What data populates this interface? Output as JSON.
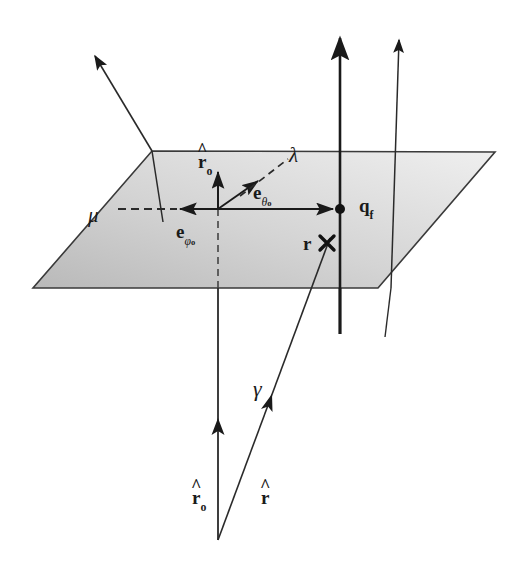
{
  "figure": {
    "kind": "vector-geometry-diagram",
    "background_color": "#ffffff",
    "stroke_color": "#1a1a1a",
    "plane_fill_light": "#e9e9e9",
    "plane_fill_dark": "#bcbcbc"
  },
  "labels": {
    "r_hat_0_plane": {
      "base": "r",
      "hat": "^",
      "sub": "o",
      "x": 198,
      "y": 152,
      "size": 19
    },
    "lambda": {
      "text": "λ",
      "x": 289,
      "y": 147,
      "size": 20
    },
    "e_theta_0": {
      "base": "e",
      "sub": "θ",
      "sub2": "o",
      "x": 253,
      "y": 190,
      "size": 19
    },
    "e_phi_0": {
      "base": "e",
      "sub": "φ",
      "sub2": "o",
      "x": 176,
      "y": 228,
      "size": 19
    },
    "mu": {
      "text": "μ",
      "x": 91,
      "y": 208,
      "size": 20
    },
    "q_f": {
      "base": "q",
      "sub": "f",
      "x": 359,
      "y": 197,
      "size": 19
    },
    "r_bold": {
      "text": "r",
      "x": 307,
      "y": 248,
      "size": 19
    },
    "gamma": {
      "text": "γ",
      "x": 255,
      "y": 384,
      "size": 21
    },
    "r_hat_0_bottom": {
      "base": "r",
      "hat": "^",
      "sub": "o",
      "x": 196,
      "y": 491,
      "size": 19
    },
    "r_hat_bottom": {
      "base": "r",
      "hat": "^",
      "x": 263,
      "y": 491,
      "size": 19
    }
  },
  "plane": {
    "name": "reference-plane",
    "points": "152,151 495,152 378,288 33,288"
  },
  "geometry": {
    "origin": {
      "x": 218,
      "y": 209
    },
    "qf_point": {
      "x": 340,
      "y": 209
    },
    "r_cross": {
      "x": 327,
      "y": 243
    },
    "apex_bottom": {
      "x": 218,
      "y": 540
    }
  },
  "vectors": [
    {
      "name": "mu-arrow",
      "desc": "mu direction arrow, up-left through plane",
      "from": [
        160,
        218
      ],
      "to": [
        89,
        48
      ]
    },
    {
      "name": "qf-vertical-arrow",
      "desc": "thick vertical arrow at q_f",
      "from": [
        340,
        330
      ],
      "to": [
        340,
        28
      ]
    },
    {
      "name": "outer-vertical-arrow",
      "desc": "thin vertical arrow right of q_f",
      "from": [
        388,
        335
      ],
      "to": [
        394,
        30
      ]
    },
    {
      "name": "r-hat-0-plane-arrow",
      "desc": "unit vector r-hat-0 in plane, upward",
      "from": [
        218,
        209
      ],
      "to": [
        218,
        160
      ]
    },
    {
      "name": "e-theta-0-arrow",
      "desc": "e theta-0 basis vector, diagonal up-right",
      "from": [
        218,
        209
      ],
      "to": [
        262,
        178
      ]
    },
    {
      "name": "e-phi-0-arrow",
      "desc": "e phi-0 basis vector, leftward solid",
      "from": [
        218,
        209
      ],
      "to": [
        185,
        209
      ]
    },
    {
      "name": "mu-dashed-arrow",
      "desc": "dashed arrow pointing left toward mu",
      "from": [
        185,
        209
      ],
      "to": [
        118,
        209
      ]
    },
    {
      "name": "radial-arrow-to-qf",
      "desc": "solid arrow from origin right to q_f",
      "from": [
        218,
        209
      ],
      "to": [
        338,
        209
      ]
    },
    {
      "name": "lambda-dashed",
      "desc": "dashed diagonal line toward lambda",
      "from": [
        238,
        196
      ],
      "to": [
        290,
        158
      ]
    },
    {
      "name": "r-hat-0-bottom-arrow",
      "desc": "r-hat-0 vertical arrow from apex upward",
      "from": [
        218,
        540
      ],
      "to": [
        218,
        300
      ]
    },
    {
      "name": "r-hat-bottom-arrow",
      "desc": "r-hat arrow from apex toward r cross",
      "from": [
        218,
        540
      ],
      "to": [
        327,
        243
      ]
    },
    {
      "name": "plane-vertical-dashed",
      "desc": "dashed vertical segment below origin inside plane",
      "from": [
        218,
        209
      ],
      "to": [
        218,
        288
      ]
    }
  ],
  "markers": {
    "qf_dot": {
      "name": "qf-point-dot",
      "x": 340,
      "y": 209,
      "r": 5
    },
    "r_cross": {
      "name": "r-cross-marker",
      "x": 327,
      "y": 243,
      "size": 9
    }
  }
}
